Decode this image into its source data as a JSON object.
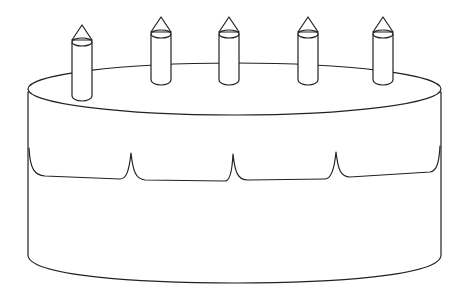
{
  "illustration": {
    "subject": "Birthday cake line drawing",
    "candle_count": 5,
    "colors": {
      "stroke": "#222222",
      "background": "#ffffff"
    },
    "candles": [
      {
        "cx": 82,
        "top": 40,
        "bottom": 101
      },
      {
        "cx": 161,
        "top": 32,
        "bottom": 85
      },
      {
        "cx": 229,
        "top": 32,
        "bottom": 85
      },
      {
        "cx": 308,
        "top": 32,
        "bottom": 85
      },
      {
        "cx": 383,
        "top": 32,
        "bottom": 85
      }
    ]
  }
}
